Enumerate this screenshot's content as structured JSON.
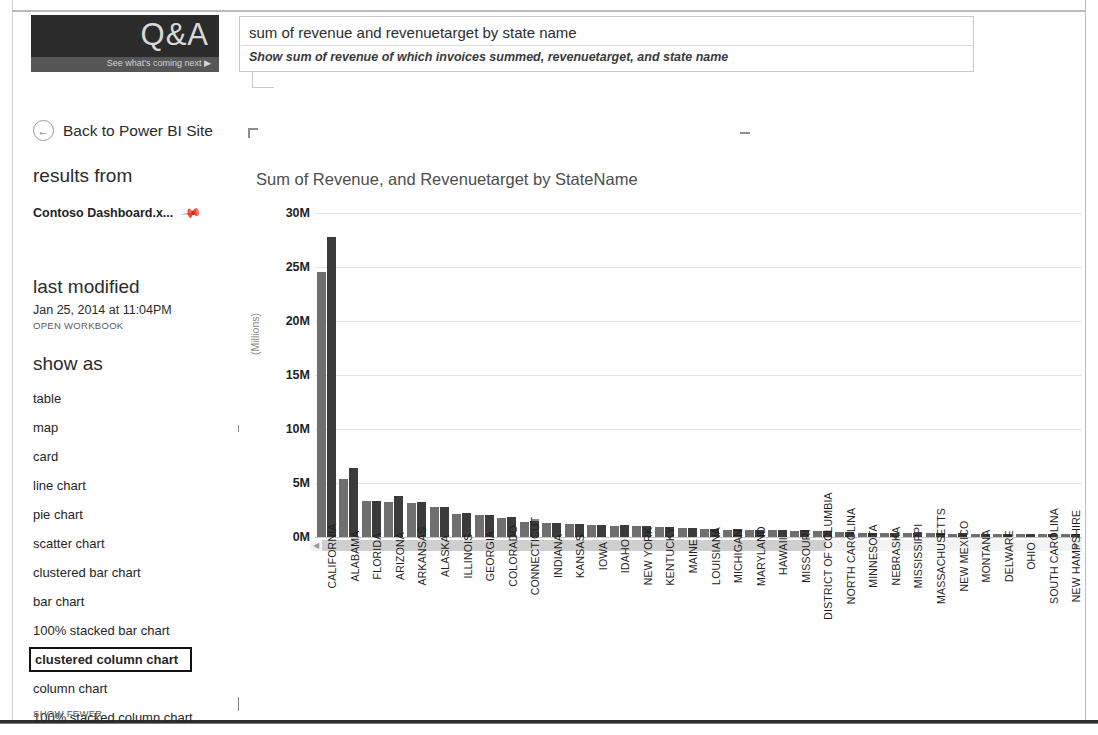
{
  "logo": {
    "title": "Q&A",
    "tagline": "See what's coming next  ▶"
  },
  "question_box": {
    "query": "sum of revenue and revenuetarget by state name",
    "interpretation": "Show sum of revenue of which invoices summed, revenuetarget, and state name"
  },
  "back_link": {
    "icon": "back-arrow-icon",
    "label": "Back to Power BI Site"
  },
  "sidebar": {
    "results_from_header": "results from",
    "workbook_name": "Contoso Dashboard.x...",
    "pin_icon": "pin-icon",
    "last_modified_header": "last modified",
    "last_modified_value": "Jan 25, 2014 at 11:04PM",
    "open_workbook_label": "OPEN WORKBOOK",
    "show_as_header": "show as",
    "show_as_items": [
      {
        "label": "table",
        "selected": false
      },
      {
        "label": "map",
        "selected": false
      },
      {
        "label": "card",
        "selected": false
      },
      {
        "label": "line chart",
        "selected": false
      },
      {
        "label": "pie chart",
        "selected": false
      },
      {
        "label": "scatter chart",
        "selected": false
      },
      {
        "label": "clustered bar chart",
        "selected": false
      },
      {
        "label": "bar chart",
        "selected": false
      },
      {
        "label": "100% stacked bar chart",
        "selected": false
      },
      {
        "label": "clustered column chart",
        "selected": true
      },
      {
        "label": "column chart",
        "selected": false
      },
      {
        "label": "100% stacked column chart",
        "selected": false
      }
    ],
    "show_fewer_label": "SHOW FEWER"
  },
  "scrollbar": {
    "left_arrow": "◀",
    "right_arrow": "▶"
  },
  "colors": {
    "revenue": "#6f6f6f",
    "revenuetarget": "#3b3b3b",
    "logo_background": "#2b2b2b",
    "selection_border": "#111111"
  },
  "chart_data": {
    "type": "bar",
    "title": "Sum of Revenue, and Revenuetarget by StateName",
    "xlabel": "",
    "ylabel": "(Millions)",
    "ylim": [
      0,
      30000000
    ],
    "ytick_labels": [
      "0M",
      "5M",
      "10M",
      "15M",
      "20M",
      "25M",
      "30M"
    ],
    "ytick_values": [
      0,
      5000000,
      10000000,
      15000000,
      20000000,
      25000000,
      30000000
    ],
    "grid": true,
    "legend": "none",
    "categories": [
      "CALIFORNIA",
      "ALABAMA",
      "FLORIDA",
      "ARIZONA",
      "ARKANSAS",
      "ALASKA",
      "ILLINOIS",
      "GEORGIA",
      "COLORADO",
      "CONNECTICUT",
      "INDIANA",
      "KANSAS",
      "IOWA",
      "IDAHO",
      "NEW YORK",
      "KENTUCKY",
      "MAINE",
      "LOUISIANA",
      "MICHIGAN",
      "MARYLAND",
      "HAWAII",
      "MISSOURI",
      "DISTRICT OF COLUMBIA",
      "NORTH CAROLINA",
      "MINNESOTA",
      "NEBRASKA",
      "MISSISSIPPI",
      "MASSACHUSETTS",
      "NEW MEXICO",
      "MONTANA",
      "DELWARE",
      "OHIO",
      "SOUTH CAROLINA",
      "NEW HAMPSHIRE"
    ],
    "series": [
      {
        "name": "Sum of Revenue",
        "color": "#6f6f6f",
        "values": [
          24500000,
          5400000,
          3300000,
          3200000,
          3150000,
          2750000,
          2100000,
          2000000,
          1800000,
          1400000,
          1300000,
          1200000,
          1100000,
          1050000,
          1000000,
          950000,
          800000,
          700000,
          680000,
          650000,
          620000,
          600000,
          560000,
          420000,
          400000,
          380000,
          360000,
          340000,
          320000,
          300000,
          280000,
          270000,
          260000,
          250000
        ]
      },
      {
        "name": "Sum of Revenuetarget",
        "color": "#3b3b3b",
        "values": [
          27800000,
          6400000,
          3350000,
          3800000,
          3250000,
          2800000,
          2200000,
          2050000,
          1850000,
          1450000,
          1320000,
          1230000,
          1150000,
          1080000,
          1020000,
          970000,
          820000,
          720000,
          700000,
          670000,
          640000,
          610000,
          580000,
          430000,
          410000,
          390000,
          370000,
          350000,
          330000,
          310000,
          290000,
          275000,
          265000,
          255000
        ]
      }
    ]
  }
}
